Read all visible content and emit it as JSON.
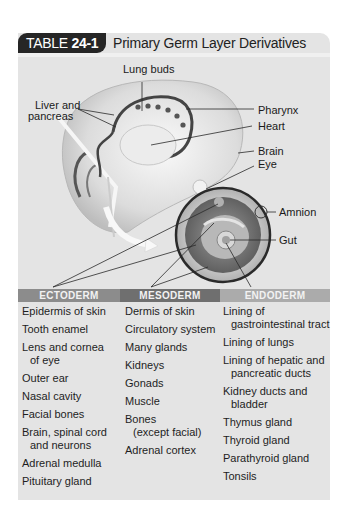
{
  "table": {
    "tag_prefix": "TABLE ",
    "tag_number": "24-1",
    "title": "Primary Germ Layer Derivatives"
  },
  "illustration": {
    "labels": {
      "lung_buds": "Lung buds",
      "liver_pancreas_line1": "Liver and",
      "liver_pancreas_line2": "pancreas",
      "pharynx": "Pharynx",
      "heart": "Heart",
      "brain": "Brain",
      "eye": "Eye",
      "amnion": "Amnion",
      "gut": "Gut"
    }
  },
  "columns": [
    {
      "header": "ECTODERM",
      "color": "#8c8c8c",
      "items": [
        {
          "line1": "Epidermis of skin"
        },
        {
          "line1": "Tooth enamel"
        },
        {
          "line1": "Lens and cornea",
          "line2": "of eye"
        },
        {
          "line1": "Outer ear"
        },
        {
          "line1": "Nasal cavity"
        },
        {
          "line1": "Facial bones"
        },
        {
          "line1": "Brain, spinal cord",
          "line2": "and neurons"
        },
        {
          "line1": "Adrenal medulla"
        },
        {
          "line1": "Pituitary gland"
        }
      ]
    },
    {
      "header": "MESODERM",
      "color": "#6f6f6f",
      "items": [
        {
          "line1": "Dermis of skin"
        },
        {
          "line1": "Circulatory system"
        },
        {
          "line1": "Many glands"
        },
        {
          "line1": "Kidneys"
        },
        {
          "line1": "Gonads"
        },
        {
          "line1": "Muscle"
        },
        {
          "line1": "Bones",
          "line2": "(except facial)"
        },
        {
          "line1": "Adrenal cortex"
        }
      ]
    },
    {
      "header": "ENDODERM",
      "color": "#ababab",
      "items": [
        {
          "line1": "Lining of",
          "line2": "gastrointestinal tract"
        },
        {
          "line1": "Lining of lungs"
        },
        {
          "line1": "Lining of hepatic and",
          "line2": "pancreatic ducts"
        },
        {
          "line1": "Kidney ducts and",
          "line2": "bladder"
        },
        {
          "line1": "Thymus gland"
        },
        {
          "line1": "Thyroid gland"
        },
        {
          "line1": "Parathyroid gland"
        },
        {
          "line1": "Tonsils"
        }
      ]
    }
  ]
}
